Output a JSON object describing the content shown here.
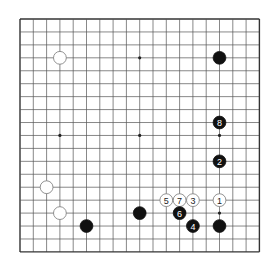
{
  "diagram": {
    "type": "go-board",
    "size": 19,
    "origin": {
      "x": 20,
      "y": 19
    },
    "spacing": {
      "x": 13.3,
      "y": 12.94
    },
    "stone_radius": 6.4,
    "colors": {
      "line": "#555555",
      "border": "#333333",
      "black": "#111111",
      "white": "#ffffff",
      "white_edge": "#777777",
      "hoshi": "#222222"
    },
    "hoshi": [
      [
        3,
        3
      ],
      [
        9,
        3
      ],
      [
        15,
        3
      ],
      [
        3,
        9
      ],
      [
        9,
        9
      ],
      [
        15,
        9
      ],
      [
        3,
        15
      ],
      [
        9,
        15
      ],
      [
        15,
        15
      ]
    ],
    "stones": [
      {
        "color": "white",
        "col": 3,
        "row": 3,
        "label": ""
      },
      {
        "color": "black",
        "col": 15,
        "row": 3,
        "label": ""
      },
      {
        "color": "black",
        "col": 15,
        "row": 8,
        "label": "8"
      },
      {
        "color": "black",
        "col": 15,
        "row": 11,
        "label": "2"
      },
      {
        "color": "white",
        "col": 11,
        "row": 14,
        "label": "5"
      },
      {
        "color": "white",
        "col": 12,
        "row": 14,
        "label": "7"
      },
      {
        "color": "white",
        "col": 13,
        "row": 14,
        "label": "3"
      },
      {
        "color": "white",
        "col": 15,
        "row": 14,
        "label": "1"
      },
      {
        "color": "black",
        "col": 12,
        "row": 15,
        "label": "6"
      },
      {
        "color": "black",
        "col": 9,
        "row": 15,
        "label": ""
      },
      {
        "color": "black",
        "col": 13,
        "row": 16,
        "label": "4"
      },
      {
        "color": "black",
        "col": 15,
        "row": 16,
        "label": ""
      },
      {
        "color": "black",
        "col": 5,
        "row": 16,
        "label": ""
      },
      {
        "color": "white",
        "col": 2,
        "row": 13,
        "label": ""
      },
      {
        "color": "white",
        "col": 3,
        "row": 15,
        "label": ""
      }
    ]
  }
}
